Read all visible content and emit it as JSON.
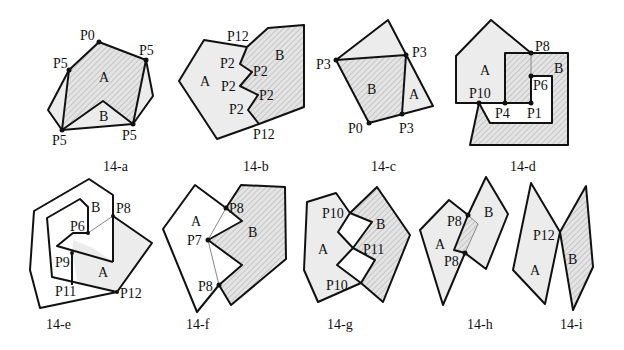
{
  "figures": [
    {
      "id": "14-a",
      "caption": "14-a",
      "labels": [
        "P0",
        "P5",
        "P5",
        "P5",
        "P5",
        "A",
        "B"
      ]
    },
    {
      "id": "14-b",
      "caption": "14-b",
      "labels": [
        "P12",
        "P2",
        "P2",
        "P2",
        "P2",
        "P2",
        "P12",
        "A",
        "B"
      ]
    },
    {
      "id": "14-c",
      "caption": "14-c",
      "labels": [
        "P3",
        "P3",
        "P0",
        "P3",
        "B",
        "A"
      ]
    },
    {
      "id": "14-d",
      "caption": "14-d",
      "labels": [
        "P8",
        "A",
        "B",
        "P6",
        "P10",
        "P4",
        "P1"
      ]
    },
    {
      "id": "14-e",
      "caption": "14-e",
      "labels": [
        "B",
        "P8",
        "P6",
        "P9",
        "A",
        "P11",
        "P12"
      ]
    },
    {
      "id": "14-f",
      "caption": "14-f",
      "labels": [
        "A",
        "P8",
        "P7",
        "B",
        "P8"
      ]
    },
    {
      "id": "14-g",
      "caption": "14-g",
      "labels": [
        "P10",
        "B",
        "A",
        "P11",
        "P10"
      ]
    },
    {
      "id": "14-h",
      "caption": "14-h",
      "labels": [
        "P8",
        "B",
        "A",
        "P8"
      ]
    },
    {
      "id": "14-i",
      "caption": "14-i",
      "labels": [
        "P12",
        "A",
        "B"
      ]
    }
  ],
  "colors": {
    "stroke": "#111111",
    "fill_a": "#ececec",
    "hatch": "#9a9a9a"
  }
}
